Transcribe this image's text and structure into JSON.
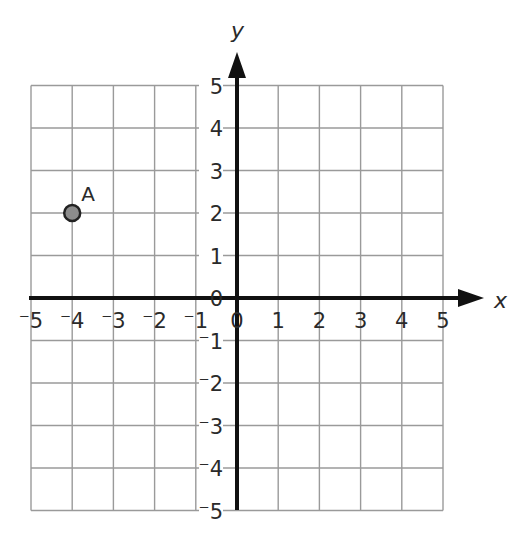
{
  "chart_data": {
    "type": "scatter",
    "title": "",
    "xlabel": "x",
    "ylabel": "y",
    "xlim": [
      -5,
      5
    ],
    "ylim": [
      -5,
      5
    ],
    "grid": true,
    "x_ticks": [
      "-5",
      "-4",
      "-3",
      "-2",
      "-1",
      "0",
      "1",
      "2",
      "3",
      "4",
      "5"
    ],
    "y_ticks": [
      "-5",
      "-4",
      "-3",
      "-2",
      "-1",
      "0",
      "1",
      "2",
      "3",
      "4",
      "5"
    ],
    "points": [
      {
        "label": "A",
        "x": -4,
        "y": 2,
        "color": "#8c8c8c"
      }
    ]
  },
  "colors": {
    "grid": "#9a9a9a",
    "axis": "#111111",
    "point_fill": "#8c8c8c",
    "point_stroke": "#222222"
  }
}
